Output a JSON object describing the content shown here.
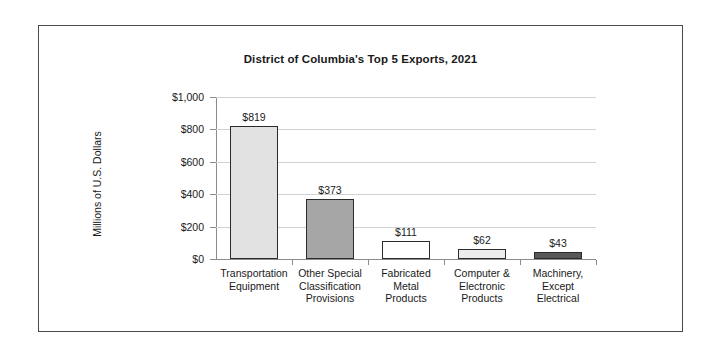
{
  "chart_data": {
    "type": "bar",
    "title": "District of Columbia's Top 5 Exports, 2021",
    "xlabel": "",
    "ylabel": "Millions of U.S. Dollars",
    "ylim": [
      0,
      1000
    ],
    "ytick_values": [
      0,
      200,
      400,
      600,
      800,
      1000
    ],
    "ytick_labels": [
      "$0",
      "$200",
      "$400",
      "$600",
      "$800",
      "$1,000"
    ],
    "grid": true,
    "legend": false,
    "categories": [
      "Transportation Equipment",
      "Other Special Classification Provisions",
      "Fabricated Metal Products",
      "Computer & Electronic Products",
      "Machinery, Except Electrical"
    ],
    "category_label_lines": [
      [
        "Transportation",
        "Equipment"
      ],
      [
        "Other Special",
        "Classification",
        "Provisions"
      ],
      [
        "Fabricated",
        "Metal",
        "Products"
      ],
      [
        "Computer &",
        "Electronic",
        "Products"
      ],
      [
        "Machinery,",
        "Except",
        "Electrical"
      ]
    ],
    "values": [
      819,
      373,
      111,
      62,
      43
    ],
    "data_labels": [
      "$819",
      "$373",
      "$111",
      "$62",
      "$43"
    ],
    "bar_colors": [
      "#e2e2e2",
      "#a6a6a6",
      "#ffffff",
      "#ececec",
      "#585858"
    ],
    "bar_edge_color": "#2b2b2b",
    "gridline_color": "#d2d2d2",
    "axis_color": "#8c8c8c",
    "text_color": "#1a1a1a",
    "frame_border_color": "#4a4a4a",
    "background_color": "#ffffff"
  }
}
